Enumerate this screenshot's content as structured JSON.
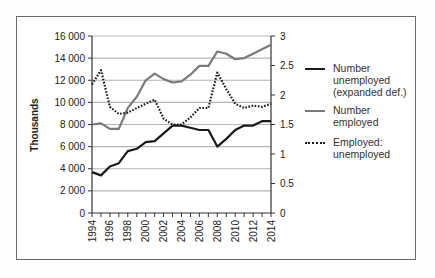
{
  "chart_data": {
    "type": "line",
    "title": "",
    "xlabel": "",
    "ylabel": "Thousands",
    "y2label": "",
    "x": [
      1994,
      1995,
      1996,
      1997,
      1998,
      1999,
      2000,
      2001,
      2002,
      2003,
      2004,
      2005,
      2006,
      2007,
      2008,
      2009,
      2010,
      2011,
      2012,
      2013,
      2014
    ],
    "x_tick_labels": [
      "1994",
      "1996",
      "1998",
      "2000",
      "2002",
      "2004",
      "2006",
      "2008",
      "2010",
      "2012",
      "2014"
    ],
    "ylim": [
      0,
      16000
    ],
    "y_tick_labels": [
      "0",
      "2 000",
      "4 000",
      "6 000",
      "8 000",
      "10 000",
      "12 000",
      "14 000",
      "16 000"
    ],
    "y2lim": [
      0,
      3
    ],
    "y2_tick_labels": [
      "0",
      "0.5",
      "1",
      "1.5",
      "2",
      "2.5",
      "3"
    ],
    "grid": "horizontal",
    "legend_position": "right",
    "series": [
      {
        "name": "Number unemployed (expanded def.)",
        "legend_lines": [
          "Number",
          "unemployed",
          "(expanded def.)"
        ],
        "axis": "left",
        "style": "solid",
        "color": "#1a1a1a",
        "width": 2.2,
        "values": [
          3700,
          3400,
          4200,
          4500,
          5600,
          5800,
          6400,
          6500,
          7200,
          7900,
          7900,
          7700,
          7500,
          7500,
          6000,
          6700,
          7500,
          7900,
          7900,
          8300,
          8300
        ]
      },
      {
        "name": "Number employed",
        "legend_lines": [
          "Number",
          "employed"
        ],
        "axis": "left",
        "style": "solid",
        "color": "#7a7a7a",
        "width": 2.2,
        "values": [
          8000,
          8100,
          7600,
          7600,
          9500,
          10500,
          12000,
          12600,
          12100,
          11800,
          11900,
          12500,
          13300,
          13300,
          14600,
          14400,
          13900,
          14000,
          14400,
          14800,
          15200
        ]
      },
      {
        "name": "Employed: unemployed",
        "legend_lines": [
          "Employed:",
          "unemployed"
        ],
        "axis": "right",
        "style": "dotted",
        "color": "#1a1a1a",
        "width": 2.2,
        "values": [
          2.18,
          2.42,
          1.8,
          1.68,
          1.7,
          1.78,
          1.85,
          1.92,
          1.6,
          1.5,
          1.5,
          1.62,
          1.78,
          1.78,
          2.38,
          2.1,
          1.85,
          1.78,
          1.82,
          1.8,
          1.85
        ]
      }
    ]
  }
}
